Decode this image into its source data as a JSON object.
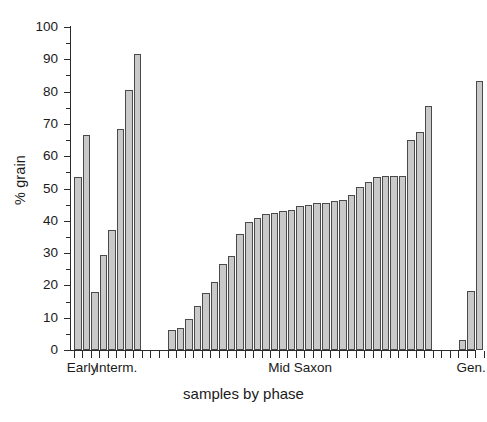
{
  "chart_data": {
    "type": "bar",
    "title": "",
    "xlabel": "samples by phase",
    "ylabel": "% grain",
    "ylim": [
      0,
      100
    ],
    "ytick_step": 10,
    "ytick_labels": [
      "0",
      "10",
      "20",
      "30",
      "40",
      "50",
      "60",
      "70",
      "80",
      "90",
      "100"
    ],
    "grid": false,
    "legend": null,
    "bar_fill_color": "#c9c9c9",
    "bar_edge_color": "#4a4a4a",
    "axis_color": "#2b2b2b",
    "groups": [
      {
        "label": "Early",
        "values": [
          53.5,
          66.5
        ]
      },
      {
        "label": "Interm.",
        "values": [
          18.0,
          29.5,
          37.0,
          68.5,
          80.5,
          91.5
        ]
      },
      {
        "label": "Mid Saxon",
        "values": [
          6.3,
          6.8,
          9.5,
          13.5,
          17.8,
          21.0,
          26.5,
          29.0,
          36.0,
          39.5,
          41.0,
          42.0,
          42.5,
          43.0,
          43.5,
          44.5,
          45.0,
          45.5,
          45.5,
          46.0,
          46.5,
          48.0,
          50.5,
          52.0,
          53.5,
          53.8,
          54.0,
          54.0,
          65.0,
          67.5,
          75.5
        ]
      },
      {
        "label": "Gen.",
        "values": [
          3.0,
          18.2,
          83.2
        ]
      }
    ],
    "values_flat": [
      53.5,
      66.5,
      18.0,
      29.5,
      37.0,
      68.5,
      80.5,
      91.5,
      6.3,
      6.8,
      9.5,
      13.5,
      17.8,
      21.0,
      26.5,
      29.0,
      36.0,
      39.5,
      41.0,
      42.0,
      42.5,
      43.0,
      43.5,
      44.5,
      45.0,
      45.5,
      45.5,
      46.0,
      46.5,
      48.0,
      50.5,
      52.0,
      53.5,
      53.8,
      54.0,
      54.0,
      65.0,
      67.5,
      75.5,
      3.0,
      18.2,
      83.2
    ]
  }
}
